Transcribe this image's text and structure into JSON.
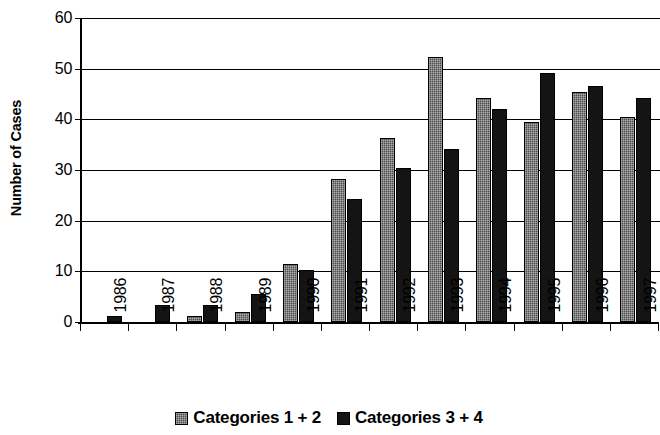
{
  "chart_data": {
    "type": "bar",
    "title": "",
    "xlabel": "",
    "ylabel": "Number of Cases",
    "ylim": [
      0,
      60
    ],
    "yticks": [
      0,
      10,
      20,
      30,
      40,
      50,
      60
    ],
    "grid": true,
    "legend_position": "bottom",
    "categories": [
      "1986",
      "1987",
      "1988",
      "1989",
      "1990",
      "1991",
      "1992",
      "1993",
      "1994",
      "1995",
      "1996",
      "1997"
    ],
    "series": [
      {
        "name": "Categories 1 + 2",
        "color": "#4d4d4d",
        "values": [
          0,
          0,
          1.2,
          2.0,
          11.5,
          28.2,
          36.3,
          52.3,
          44.2,
          39.5,
          45.4,
          40.4
        ]
      },
      {
        "name": "Categories 3 + 4",
        "color": "#141414",
        "values": [
          1.2,
          3.3,
          3.3,
          5.5,
          10.3,
          24.3,
          30.3,
          34.2,
          42.1,
          49.2,
          46.5,
          44.2
        ]
      }
    ]
  },
  "legend": {
    "entries": [
      {
        "label": "Categories 1 + 2"
      },
      {
        "label": "Categories 3 + 4"
      }
    ]
  }
}
